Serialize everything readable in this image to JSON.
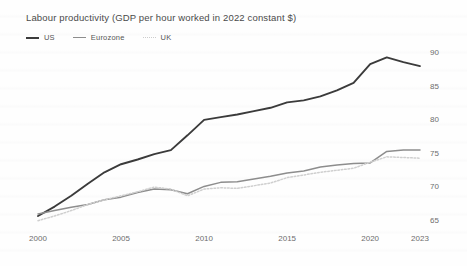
{
  "chart_data": {
    "type": "line",
    "title": "Labour productivity (GDP per hour worked in 2022 constant $)",
    "xlabel": "",
    "ylabel": "",
    "grid": false,
    "legend_position": "top-left",
    "xlim": [
      2000,
      2023
    ],
    "ylim": [
      62.5,
      91.5
    ],
    "xticks": [
      2000,
      2005,
      2010,
      2015,
      2020,
      2023
    ],
    "xtick_labels": [
      "2000",
      "2005",
      "2010",
      "2015",
      "2020",
      "2023"
    ],
    "yticks": [
      65,
      70,
      75,
      80,
      85,
      90
    ],
    "ytick_labels": [
      "65",
      "70",
      "75",
      "80",
      "85",
      "90"
    ],
    "x": [
      2000,
      2001,
      2002,
      2003,
      2004,
      2005,
      2006,
      2007,
      2008,
      2009,
      2010,
      2011,
      2012,
      2013,
      2014,
      2015,
      2016,
      2017,
      2018,
      2019,
      2020,
      2021,
      2022,
      2023
    ],
    "series": [
      {
        "name": "US",
        "color": "#3b3b3b",
        "style": "solid",
        "values": [
          65.6,
          67.0,
          68.6,
          70.4,
          72.1,
          73.3,
          74.0,
          74.8,
          75.4,
          77.6,
          79.9,
          80.3,
          80.7,
          81.2,
          81.7,
          82.5,
          82.8,
          83.4,
          84.3,
          85.4,
          88.2,
          89.2,
          88.5,
          87.9
        ]
      },
      {
        "name": "Eurozone",
        "color": "#8d8d8d",
        "style": "solid",
        "values": [
          65.9,
          66.4,
          66.9,
          67.3,
          68.0,
          68.4,
          69.1,
          69.6,
          69.5,
          68.9,
          70.0,
          70.6,
          70.7,
          71.1,
          71.5,
          72.0,
          72.3,
          72.9,
          73.2,
          73.4,
          73.5,
          75.2,
          75.4,
          75.4
        ]
      },
      {
        "name": "UK",
        "color": "#cfcfcf",
        "style": "dotted",
        "values": [
          64.9,
          65.6,
          66.4,
          67.3,
          68.0,
          68.6,
          69.2,
          69.9,
          69.6,
          68.6,
          69.6,
          69.8,
          69.7,
          70.1,
          70.5,
          71.3,
          71.7,
          72.1,
          72.4,
          72.7,
          73.6,
          74.4,
          74.3,
          74.2
        ]
      }
    ]
  },
  "legend": {
    "items": [
      {
        "label": "US"
      },
      {
        "label": "Eurozone"
      },
      {
        "label": "UK"
      }
    ]
  }
}
